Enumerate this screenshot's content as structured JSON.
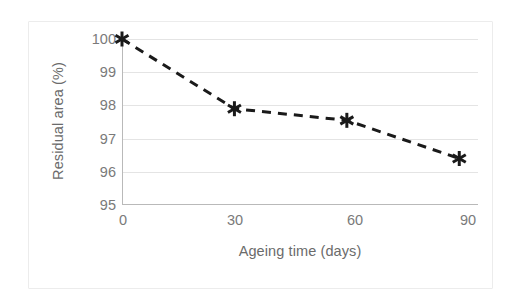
{
  "chart_data": {
    "type": "line",
    "title": "",
    "xlabel": "Ageing time (days)",
    "ylabel": "Residual area (%)",
    "x": [
      0,
      30,
      60,
      90
    ],
    "xticklabels": [
      "0",
      "30",
      "60",
      "90"
    ],
    "values": [
      100.0,
      97.9,
      97.55,
      96.4
    ],
    "yticks": [
      95,
      96,
      97,
      98,
      99,
      100
    ],
    "yticklabels": [
      "95",
      "96",
      "97",
      "98",
      "99",
      "100"
    ],
    "xlim": [
      0,
      95
    ],
    "ylim": [
      95,
      100
    ],
    "grid": "horizontal",
    "legend": "none",
    "series": [
      {
        "name": "Residual area",
        "values": [
          100.0,
          97.9,
          97.55,
          96.4
        ],
        "line_style": "dashed",
        "line_color": "#1a1a1a",
        "marker": "asterisk",
        "marker_color": "#1a1a1a"
      }
    ],
    "colors": {
      "line": "#1a1a1a",
      "marker": "#1a1a1a",
      "gridline": "#e4e4e4",
      "axis": "#b9b9b9",
      "tick_text": "#7a7a7a",
      "title_text": "#6b6b6b",
      "background": "#ffffff",
      "frame": "#ececec"
    }
  }
}
